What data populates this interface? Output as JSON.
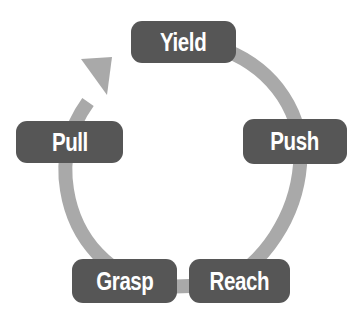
{
  "diagram": {
    "type": "cycle",
    "colors": {
      "node_fill": "#565656",
      "node_text": "#ffffff",
      "arc": "#a9a9a9",
      "background": "#ffffff"
    },
    "nodes": [
      {
        "id": "yield",
        "label": "Yield"
      },
      {
        "id": "push",
        "label": "Push"
      },
      {
        "id": "reach",
        "label": "Reach"
      },
      {
        "id": "grasp",
        "label": "Grasp"
      },
      {
        "id": "pull",
        "label": "Pull"
      }
    ],
    "flow": [
      "Yield",
      "Push",
      "Reach",
      "Grasp",
      "Pull",
      "Yield"
    ],
    "arrow_direction": "clockwise"
  }
}
